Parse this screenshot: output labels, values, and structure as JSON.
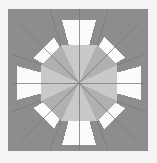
{
  "figure": {
    "title": "Eight-Pointed Star Quilt Block",
    "alt_text": "Geometric eight-pointed star quilt block in shades of gray and white",
    "canvas": {
      "width": 157,
      "height": 163
    },
    "page_background": "#f4f4f4",
    "block": {
      "name": "star-block",
      "x": 8,
      "y": 9,
      "width": 140,
      "height": 142,
      "center_x": 79,
      "center_y": 83
    },
    "palette": {
      "background_margin": "#f2f2f2",
      "block_field_dark": "#8d8d8d",
      "block_field_dark_alt": "#909090",
      "star_point_white": "#fbfbfb",
      "star_point_offwhite": "#f3f3f3",
      "center_gray_light": "#c9c9c9",
      "center_gray_medium": "#b0b0b0",
      "seam_line": "#7a7a7a"
    },
    "structure": {
      "type": "eight-pointed-star",
      "ring_count": 2,
      "center_wedges": 8,
      "star_points": 8,
      "corner_triangles": 4
    },
    "patches": [
      {
        "id": "field-top-left",
        "name": "corner-field-top-left",
        "fill": "#8d8d8d",
        "points": "8,9 79,9 8,80"
      },
      {
        "id": "field-top-right",
        "name": "corner-field-top-right",
        "fill": "#8d8d8d",
        "points": "79,9 148,9 148,80"
      },
      {
        "id": "field-bottom-right",
        "name": "corner-field-bottom-right",
        "fill": "#8d8d8d",
        "points": "148,80 148,151 79,151"
      },
      {
        "id": "field-bottom-left",
        "name": "corner-field-bottom-left",
        "fill": "#8d8d8d",
        "points": "79,151 8,151 8,80"
      },
      {
        "id": "ring-n-left",
        "name": "ring-wedge-north-left",
        "fill": "#8d8d8d",
        "points": "79,83 50,11 79,11"
      },
      {
        "id": "ring-n-right",
        "name": "ring-wedge-north-right",
        "fill": "#8d8d8d",
        "points": "79,83 79,11 108,11"
      },
      {
        "id": "ring-e-top",
        "name": "ring-wedge-east-top",
        "fill": "#8d8d8d",
        "points": "79,83 146,54 146,83"
      },
      {
        "id": "ring-e-bot",
        "name": "ring-wedge-east-bottom",
        "fill": "#8d8d8d",
        "points": "79,83 146,83 146,112"
      },
      {
        "id": "ring-s-right",
        "name": "ring-wedge-south-right",
        "fill": "#8d8d8d",
        "points": "79,83 108,149 79,149"
      },
      {
        "id": "ring-s-left",
        "name": "ring-wedge-south-left",
        "fill": "#8d8d8d",
        "points": "79,83 79,149 50,149"
      },
      {
        "id": "ring-w-bot",
        "name": "ring-wedge-west-bottom",
        "fill": "#8d8d8d",
        "points": "79,83 11,112 11,83"
      },
      {
        "id": "ring-w-top",
        "name": "ring-wedge-west-top",
        "fill": "#8d8d8d",
        "points": "79,83 11,83 11,54"
      },
      {
        "id": "star-n",
        "name": "star-point-north",
        "fill": "#fbfbfb",
        "points": "79,83 62,20 96,20"
      },
      {
        "id": "star-ne",
        "name": "star-point-northeast",
        "fill": "#fbfbfb",
        "points": "79,83 104,37 125,58"
      },
      {
        "id": "star-e",
        "name": "star-point-east",
        "fill": "#fbfbfb",
        "points": "79,83 141,66 141,100"
      },
      {
        "id": "star-se",
        "name": "star-point-southeast",
        "fill": "#fbfbfb",
        "points": "79,83 125,108 104,129"
      },
      {
        "id": "star-s",
        "name": "star-point-south",
        "fill": "#fbfbfb",
        "points": "79,83 96,145 62,145"
      },
      {
        "id": "star-sw",
        "name": "star-point-southwest",
        "fill": "#fbfbfb",
        "points": "79,83 54,129 33,108"
      },
      {
        "id": "star-w",
        "name": "star-point-west",
        "fill": "#fbfbfb",
        "points": "79,83 17,100 17,66"
      },
      {
        "id": "star-nw",
        "name": "star-point-northwest",
        "fill": "#fbfbfb",
        "points": "79,83 33,58 54,37"
      },
      {
        "id": "core-n",
        "name": "center-wedge-north",
        "fill": "#c9c9c9",
        "points": "79,83 61,45 97,45"
      },
      {
        "id": "core-ne",
        "name": "center-wedge-northeast",
        "fill": "#b0b0b0",
        "points": "79,83 97,45 117,65"
      },
      {
        "id": "core-e",
        "name": "center-wedge-east",
        "fill": "#c9c9c9",
        "points": "79,83 117,65 117,101"
      },
      {
        "id": "core-se",
        "name": "center-wedge-southeast",
        "fill": "#b0b0b0",
        "points": "79,83 117,101 97,121"
      },
      {
        "id": "core-s",
        "name": "center-wedge-south",
        "fill": "#c9c9c9",
        "points": "79,83 97,121 61,121"
      },
      {
        "id": "core-sw",
        "name": "center-wedge-southwest",
        "fill": "#b0b0b0",
        "points": "79,83 61,121 41,101"
      },
      {
        "id": "core-w",
        "name": "center-wedge-west",
        "fill": "#c9c9c9",
        "points": "79,83 41,101 41,65"
      },
      {
        "id": "core-nw",
        "name": "center-wedge-northwest",
        "fill": "#b0b0b0",
        "points": "79,83 41,65 61,45"
      }
    ],
    "seams": [
      {
        "name": "seam-vertical",
        "x1": 79,
        "y1": 9,
        "x2": 79,
        "y2": 151
      },
      {
        "name": "seam-horizontal",
        "x1": 11,
        "y1": 83,
        "x2": 146,
        "y2": 83
      },
      {
        "name": "seam-diagonal-nwse",
        "x1": 20,
        "y1": 24,
        "x2": 138,
        "y2": 142
      },
      {
        "name": "seam-diagonal-nesw",
        "x1": 138,
        "y1": 24,
        "x2": 20,
        "y2": 142
      },
      {
        "name": "seam-octagon-ne",
        "x1": 117,
        "y1": 65,
        "x2": 146,
        "y2": 54
      },
      {
        "name": "seam-octagon-nw",
        "x1": 41,
        "y1": 65,
        "x2": 11,
        "y2": 54
      },
      {
        "name": "seam-octagon-se",
        "x1": 117,
        "y1": 101,
        "x2": 146,
        "y2": 112
      },
      {
        "name": "seam-octagon-sw",
        "x1": 41,
        "y1": 101,
        "x2": 11,
        "y2": 112
      },
      {
        "name": "seam-octagon-nn-left",
        "x1": 61,
        "y1": 45,
        "x2": 50,
        "y2": 11
      },
      {
        "name": "seam-octagon-nn-right",
        "x1": 97,
        "y1": 45,
        "x2": 108,
        "y2": 11
      },
      {
        "name": "seam-octagon-ss-left",
        "x1": 61,
        "y1": 121,
        "x2": 50,
        "y2": 149
      },
      {
        "name": "seam-octagon-ss-right",
        "x1": 97,
        "y1": 121,
        "x2": 108,
        "y2": 149
      }
    ]
  }
}
